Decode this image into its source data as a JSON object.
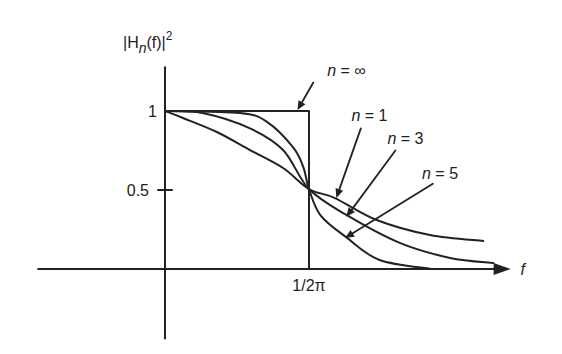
{
  "chart_data": {
    "type": "line",
    "title": "",
    "ylabel": {
      "base": "|H",
      "sub": "n",
      "rest": "(f)|",
      "sup": "2"
    },
    "xlabel": "f",
    "x_ticks": [
      {
        "value": 1,
        "label": "1/2π"
      }
    ],
    "y_ticks": [
      {
        "value": 1,
        "label": "1"
      },
      {
        "value": 0.5,
        "label": "0.5"
      }
    ],
    "grid": false,
    "legend": "inline annotations with arrows",
    "x_unit_note": "x normalized to cutoff frequency 1/2π",
    "series": [
      {
        "name": "n = ∞",
        "style": "ideal",
        "x": [
          0,
          1,
          1
        ],
        "values": [
          1,
          1,
          0
        ]
      },
      {
        "name": "n = 1",
        "x": [
          0,
          0.125,
          0.36,
          0.59,
          0.82,
          1.0,
          1.18,
          1.47,
          1.84,
          2.21
        ],
        "values": [
          1.0,
          0.956,
          0.867,
          0.753,
          0.639,
          0.506,
          0.449,
          0.31,
          0.215,
          0.177
        ]
      },
      {
        "name": "n = 3",
        "x": [
          0,
          0.26,
          0.59,
          0.82,
          1.0,
          1.26,
          1.63,
          1.98,
          2.28
        ],
        "values": [
          1.0,
          0.987,
          0.89,
          0.753,
          0.506,
          0.342,
          0.165,
          0.07,
          0.038
        ]
      },
      {
        "name": "n = 5",
        "x": [
          0,
          0.52,
          0.71,
          0.89,
          0.96,
          1.0,
          1.08,
          1.26,
          1.49,
          1.85
        ],
        "values": [
          1.0,
          0.987,
          0.93,
          0.77,
          0.646,
          0.506,
          0.34,
          0.2,
          0.057,
          0.0
        ]
      }
    ],
    "annotations": [
      {
        "text": "n = ∞",
        "at": [
          1.26,
          1.26
        ],
        "arrow_from": [
          1.03,
          1.18
        ],
        "arrow_to": [
          0.92,
          1.006
        ]
      },
      {
        "text": "n = 1",
        "at": [
          1.42,
          0.975
        ],
        "arrow_from": [
          1.36,
          0.89
        ],
        "arrow_to": [
          1.19,
          0.45
        ]
      },
      {
        "text": "n = 3",
        "at": [
          1.67,
          0.83
        ],
        "arrow_from": [
          1.6,
          0.75
        ],
        "arrow_to": [
          1.26,
          0.33
        ]
      },
      {
        "text": "n = 5",
        "at": [
          1.91,
          0.61
        ],
        "arrow_from": [
          1.86,
          0.54
        ],
        "arrow_to": [
          1.25,
          0.196
        ]
      }
    ],
    "xlim": [
      -0.95,
      2.4
    ],
    "ylim": [
      -0.44,
      1.34
    ]
  }
}
